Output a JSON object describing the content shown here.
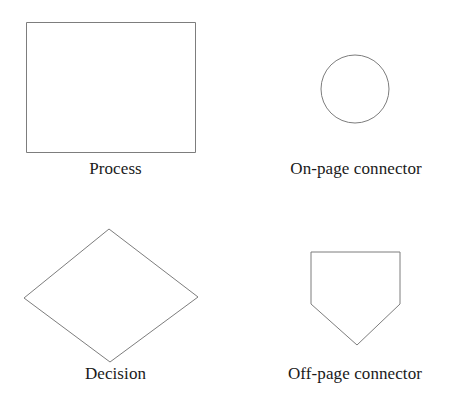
{
  "page": {
    "background_color": "#ffffff",
    "stroke_color": "#7d7d7d",
    "text_color": "#1a1a1a"
  },
  "symbols": [
    {
      "id": "process",
      "shape": "rectangle",
      "label": "Process",
      "geometry": {
        "x": 26,
        "y": 22,
        "width": 170,
        "height": 131
      }
    },
    {
      "id": "on-page-connector",
      "shape": "circle",
      "label": "On-page connector",
      "geometry": {
        "cx": 355,
        "cy": 89,
        "r": 34
      }
    },
    {
      "id": "decision",
      "shape": "diamond",
      "label": "Decision",
      "geometry": {
        "points": "109,229 198,297 110,362 24,298"
      }
    },
    {
      "id": "off-page-connector",
      "shape": "pentagon-down",
      "label": "Off-page connector",
      "geometry": {
        "points": "311,251 400,251 400,303 357,344 311,303"
      }
    }
  ]
}
